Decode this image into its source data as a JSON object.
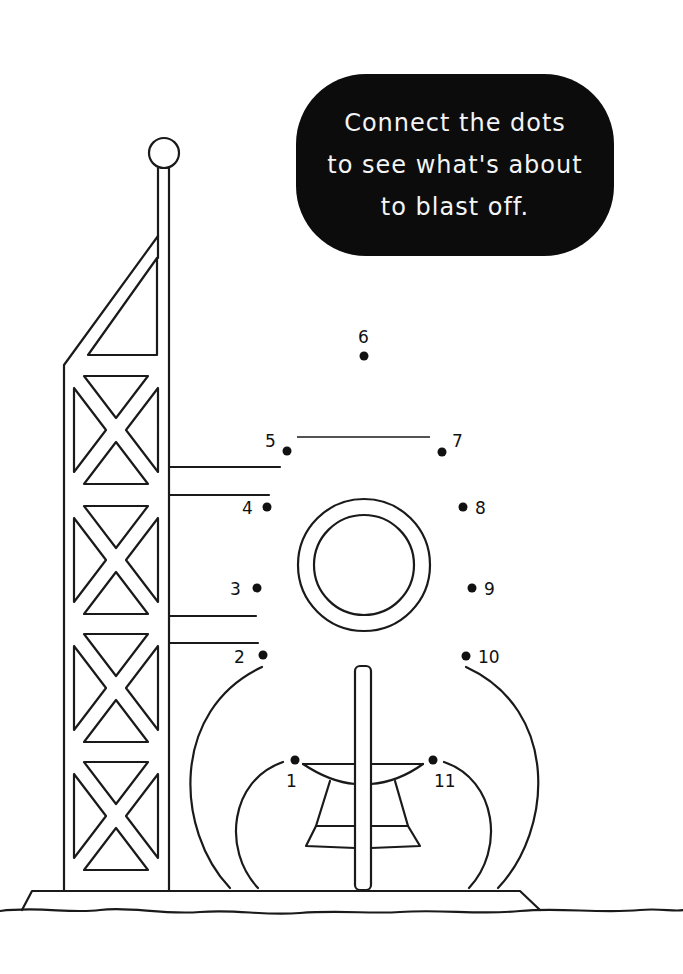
{
  "instruction": {
    "lines": [
      "Connect the dots",
      "to see what's about",
      "to blast off."
    ],
    "bubble_color": "#0c0c0c",
    "text_color": "#f4f4f4"
  },
  "dots": [
    {
      "label": "1",
      "x": 295,
      "y": 760
    },
    {
      "label": "2",
      "x": 263,
      "y": 655
    },
    {
      "label": "3",
      "x": 257,
      "y": 588
    },
    {
      "label": "4",
      "x": 267,
      "y": 507
    },
    {
      "label": "5",
      "x": 287,
      "y": 451
    },
    {
      "label": "6",
      "x": 364,
      "y": 356
    },
    {
      "label": "7",
      "x": 442,
      "y": 452
    },
    {
      "label": "8",
      "x": 463,
      "y": 507
    },
    {
      "label": "9",
      "x": 472,
      "y": 588
    },
    {
      "label": "10",
      "x": 466,
      "y": 656
    },
    {
      "label": "11",
      "x": 433,
      "y": 760
    }
  ],
  "scene": {
    "subject": "launch tower and rocket outline",
    "tower_panels": 4
  }
}
